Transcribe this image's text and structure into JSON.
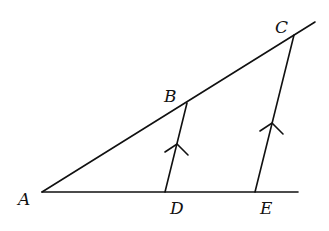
{
  "diagram": {
    "points": {
      "A": {
        "label": "A",
        "x": 42,
        "y": 192
      },
      "B": {
        "label": "B",
        "x": 187,
        "y": 103
      },
      "C": {
        "label": "C",
        "x": 294,
        "y": 35
      },
      "D": {
        "label": "D",
        "x": 165,
        "y": 192
      },
      "E": {
        "label": "E",
        "x": 255,
        "y": 192
      }
    },
    "segments": [
      "A-ray through B and C",
      "A-horizontal through D and E",
      "B-D",
      "C-E"
    ],
    "parallel_marks": [
      "BD",
      "CE"
    ],
    "colors": {
      "stroke": "#111111",
      "background": "#ffffff"
    }
  }
}
